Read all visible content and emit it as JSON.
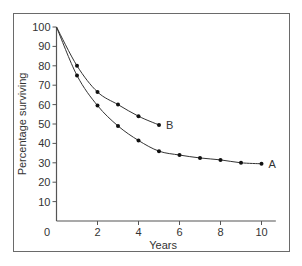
{
  "chart_data": {
    "type": "line",
    "title": "",
    "xlabel": "Years",
    "ylabel": "Percentage surviving",
    "xlim": [
      0,
      10.5
    ],
    "ylim": [
      0,
      100
    ],
    "x_ticks": [
      0,
      2,
      4,
      6,
      8,
      10
    ],
    "y_ticks": [
      10,
      20,
      30,
      40,
      50,
      60,
      70,
      80,
      90,
      100
    ],
    "grid": false,
    "legend": "inline labels at line ends",
    "series": [
      {
        "name": "A",
        "x": [
          0,
          1,
          2,
          3,
          4,
          5,
          6,
          7,
          8,
          9,
          10
        ],
        "values": [
          100,
          75,
          59.5,
          49,
          41.5,
          36,
          34,
          32.5,
          31.5,
          30,
          29.5
        ]
      },
      {
        "name": "B",
        "x": [
          0,
          1,
          2,
          3,
          4,
          5
        ],
        "values": [
          100,
          80,
          66.5,
          60,
          54,
          49.5
        ]
      }
    ]
  }
}
